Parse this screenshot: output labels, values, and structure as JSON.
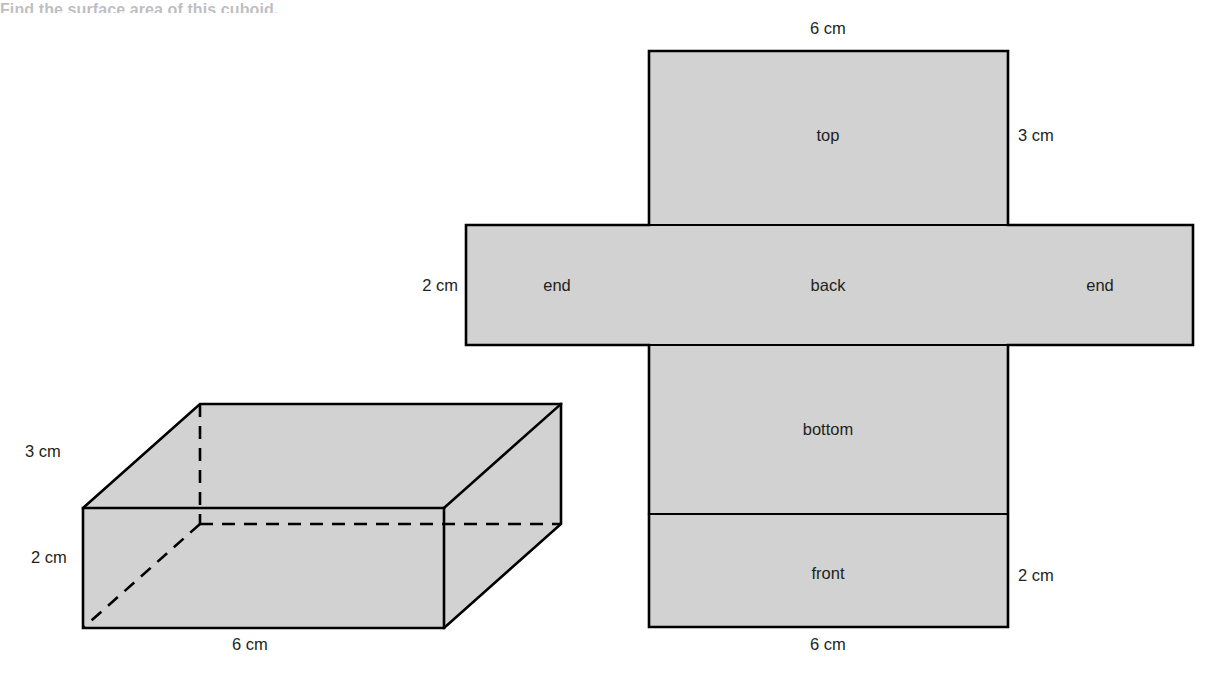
{
  "page": {
    "heading_partial": "Find the surface area of this cuboid.",
    "background_color": "#ffffff",
    "face_fill_color": "#d2d2d2",
    "line_color": "#000000",
    "text_color": "#231f20"
  },
  "cuboid": {
    "name": "cuboid-3d-figure",
    "dimension_labels": {
      "depth": "3 cm",
      "height": "2 cm",
      "width": "6 cm"
    },
    "geometry": {
      "front_top_left": [
        83,
        508
      ],
      "front_top_right": [
        444,
        508
      ],
      "front_bottom_left": [
        83,
        628
      ],
      "front_bottom_right": [
        444,
        628
      ],
      "back_top_left": [
        200,
        404
      ],
      "back_top_right": [
        561,
        404
      ],
      "back_bottom_right": [
        561,
        524
      ],
      "hidden_vertex": [
        200,
        524
      ]
    }
  },
  "net": {
    "name": "cuboid-net-figure",
    "faces": [
      {
        "key": "top",
        "label": "top",
        "x": 649,
        "y": 51,
        "w": 359,
        "h": 174
      },
      {
        "key": "end_left",
        "label": "end",
        "x": 466,
        "y": 225,
        "w": 183,
        "h": 120
      },
      {
        "key": "back",
        "label": "back",
        "x": 649,
        "y": 225,
        "w": 359,
        "h": 120
      },
      {
        "key": "end_right",
        "label": "end",
        "x": 1008,
        "y": 225,
        "w": 185,
        "h": 120
      },
      {
        "key": "bottom",
        "label": "bottom",
        "x": 649,
        "y": 345,
        "w": 359,
        "h": 169
      },
      {
        "key": "front",
        "label": "front",
        "x": 649,
        "y": 514,
        "w": 359,
        "h": 113
      }
    ],
    "dimension_labels": {
      "top_width": "6 cm",
      "top_right_height": "3 cm",
      "end_left_height": "2 cm",
      "front_right_height": "2 cm",
      "front_width": "6 cm"
    }
  }
}
